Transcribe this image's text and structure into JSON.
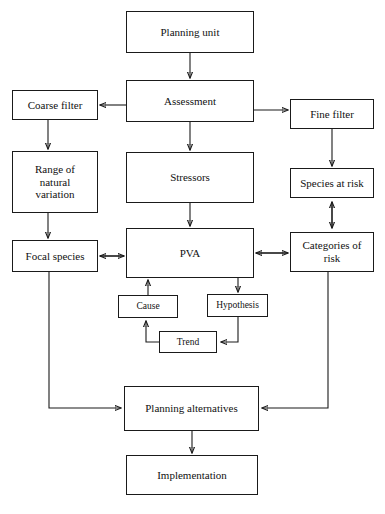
{
  "diagram": {
    "background_color": "#ffffff",
    "line_color": "#1a1a1a",
    "text_color": "#111111",
    "nodes": [
      {
        "id": "planning_unit",
        "label": "Planning unit",
        "x": 126,
        "y": 11,
        "w": 128,
        "h": 42
      },
      {
        "id": "assessment",
        "label": "Assessment",
        "x": 126,
        "y": 80,
        "w": 128,
        "h": 42
      },
      {
        "id": "coarse_filter",
        "label": "Coarse filter",
        "x": 12,
        "y": 90,
        "w": 86,
        "h": 30
      },
      {
        "id": "fine_filter",
        "label": "Fine filter",
        "x": 290,
        "y": 99,
        "w": 84,
        "h": 30
      },
      {
        "id": "range_natural_variation",
        "label": "Range of\nnatural\nvariation",
        "x": 12,
        "y": 151,
        "w": 86,
        "h": 62
      },
      {
        "id": "stressors",
        "label": "Stressors",
        "x": 126,
        "y": 152,
        "w": 128,
        "h": 51
      },
      {
        "id": "species_at_risk",
        "label": "Species at risk",
        "x": 290,
        "y": 168,
        "w": 84,
        "h": 30
      },
      {
        "id": "focal_species",
        "label": "Focal species",
        "x": 12,
        "y": 240,
        "w": 86,
        "h": 32
      },
      {
        "id": "pva",
        "label": "PVA",
        "x": 126,
        "y": 228,
        "w": 128,
        "h": 50
      },
      {
        "id": "categories_of_risk",
        "label": "Categories of\nrisk",
        "x": 290,
        "y": 232,
        "w": 84,
        "h": 40
      },
      {
        "id": "cause",
        "label": "Cause",
        "x": 118,
        "y": 295,
        "w": 60,
        "h": 23
      },
      {
        "id": "hypothesis",
        "label": "Hypothesis",
        "x": 207,
        "y": 294,
        "w": 61,
        "h": 23
      },
      {
        "id": "trend",
        "label": "Trend",
        "x": 159,
        "y": 331,
        "w": 58,
        "h": 22
      },
      {
        "id": "planning_alternatives",
        "label": "Planning alternatives",
        "x": 124,
        "y": 386,
        "w": 135,
        "h": 45
      },
      {
        "id": "implementation",
        "label": "Implementation",
        "x": 126,
        "y": 455,
        "w": 132,
        "h": 40
      }
    ],
    "edges": [
      {
        "id": "planning_unit-to-assessment",
        "from": "planning_unit",
        "to": "assessment",
        "type": "single"
      },
      {
        "id": "assessment-to-coarse_filter",
        "from": "assessment",
        "to": "coarse_filter",
        "type": "single"
      },
      {
        "id": "assessment-to-fine_filter",
        "from": "assessment",
        "to": "fine_filter",
        "type": "single"
      },
      {
        "id": "assessment-to-stressors",
        "from": "assessment",
        "to": "stressors",
        "type": "single"
      },
      {
        "id": "coarse_filter-to-range",
        "from": "coarse_filter",
        "to": "range_natural_variation",
        "type": "single"
      },
      {
        "id": "fine_filter-to-species_at_risk",
        "from": "fine_filter",
        "to": "species_at_risk",
        "type": "single"
      },
      {
        "id": "range-to-focal_species",
        "from": "range_natural_variation",
        "to": "focal_species",
        "type": "single"
      },
      {
        "id": "stressors-to-pva",
        "from": "stressors",
        "to": "pva",
        "type": "single"
      },
      {
        "id": "species_at_risk-categories",
        "from": "species_at_risk",
        "to": "categories_of_risk",
        "type": "double"
      },
      {
        "id": "focal_species-pva",
        "from": "focal_species",
        "to": "pva",
        "type": "double"
      },
      {
        "id": "pva-categories",
        "from": "pva",
        "to": "categories_of_risk",
        "type": "double"
      },
      {
        "id": "pva-to-hypothesis",
        "from": "pva",
        "to": "hypothesis",
        "type": "single"
      },
      {
        "id": "hypothesis-to-trend",
        "from": "hypothesis",
        "to": "trend",
        "type": "single"
      },
      {
        "id": "trend-to-cause",
        "from": "trend",
        "to": "cause",
        "type": "single"
      },
      {
        "id": "cause-to-pva",
        "from": "cause",
        "to": "pva",
        "type": "single"
      },
      {
        "id": "focal_species-to-planning_alt",
        "from": "focal_species",
        "to": "planning_alternatives",
        "type": "single"
      },
      {
        "id": "categories-to-planning_alt",
        "from": "categories_of_risk",
        "to": "planning_alternatives",
        "type": "single"
      },
      {
        "id": "planning_alt-to-implementation",
        "from": "planning_alternatives",
        "to": "implementation",
        "type": "single"
      }
    ]
  }
}
